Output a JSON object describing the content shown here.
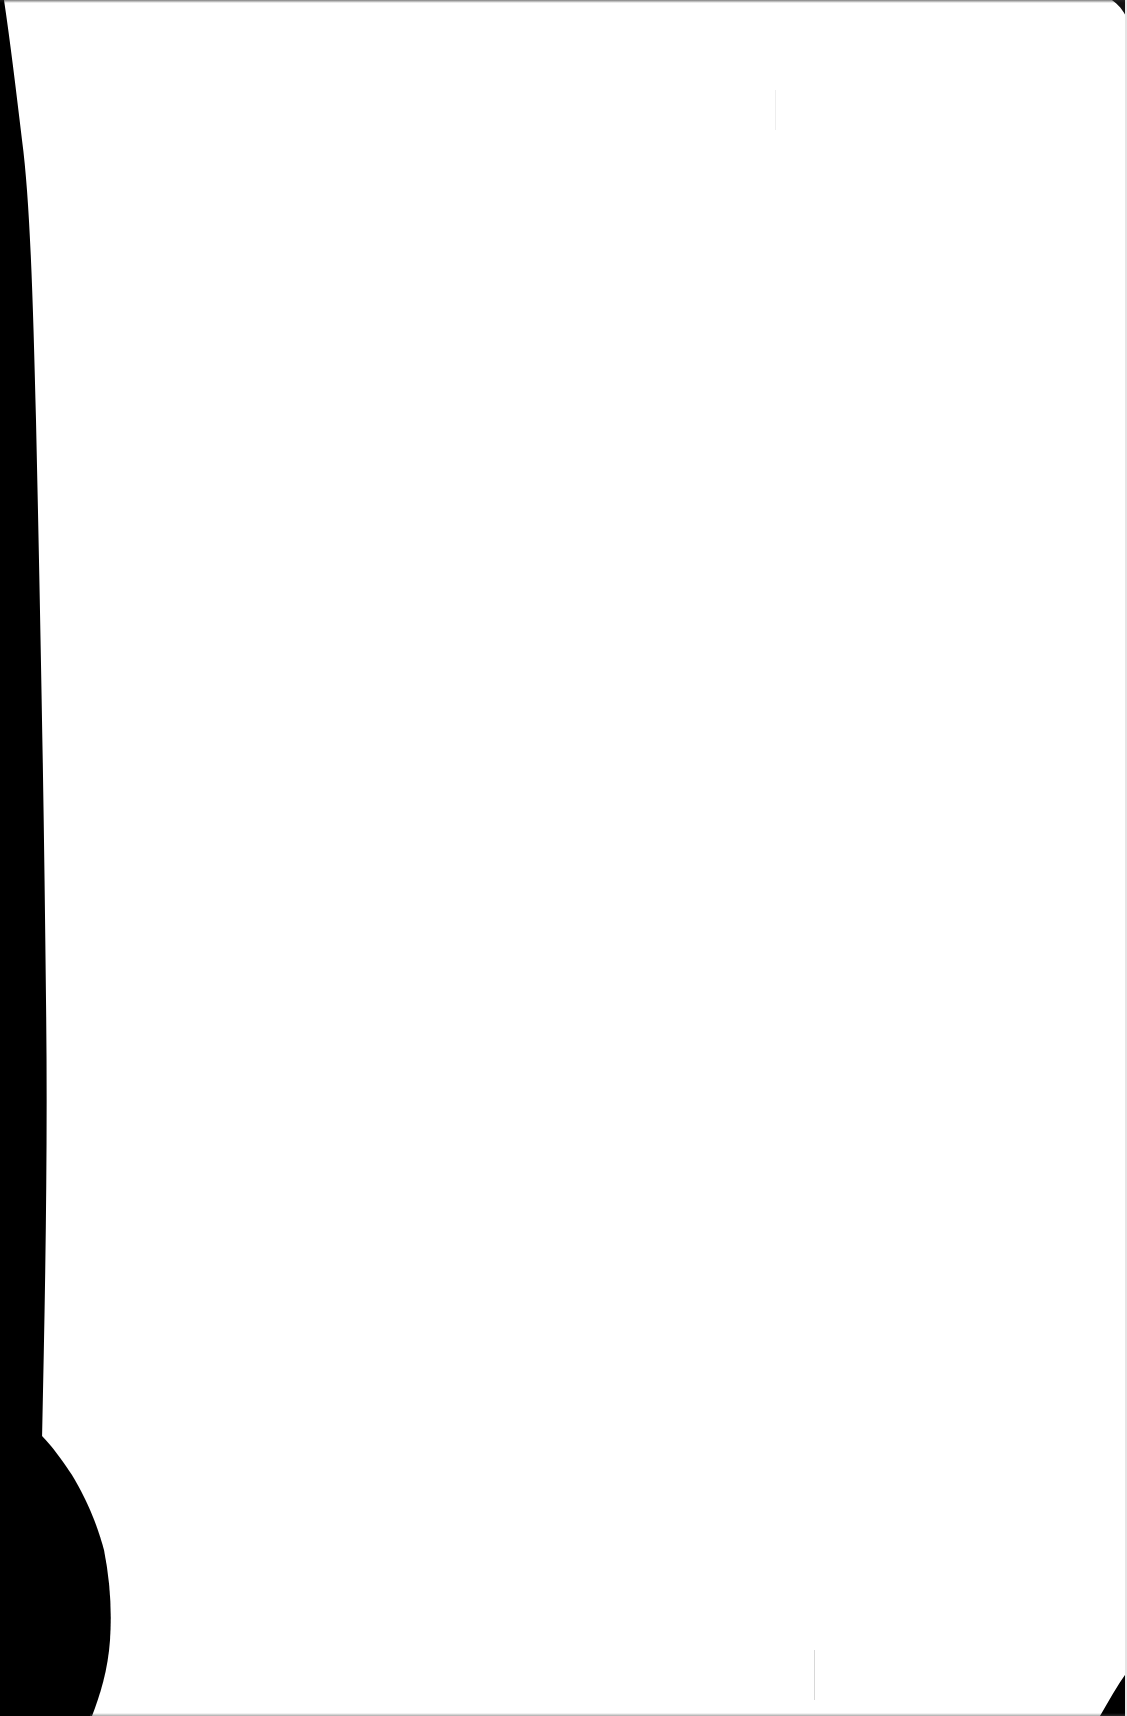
{
  "document": {
    "type": "scanned-page",
    "content": "",
    "colors": {
      "paper": "#ffffff",
      "scan_shadow": "#000000"
    }
  }
}
